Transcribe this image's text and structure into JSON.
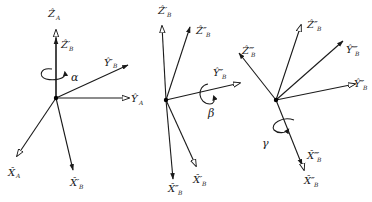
{
  "figure": {
    "panels": [
      {
        "id": "panel-1",
        "rotation": {
          "symbol": "α",
          "about": "Z"
        },
        "axes": [
          {
            "name": "Z",
            "hat": "^",
            "sub": "A",
            "prime": ""
          },
          {
            "name": "Z",
            "hat": "^",
            "sub": "B",
            "prime": "′"
          },
          {
            "name": "Y",
            "hat": "^",
            "sub": "B",
            "prime": "′"
          },
          {
            "name": "Y",
            "hat": "^",
            "sub": "A",
            "prime": ""
          },
          {
            "name": "X",
            "hat": "^",
            "sub": "A",
            "prime": ""
          },
          {
            "name": "X",
            "hat": "^",
            "sub": "B",
            "prime": "′"
          }
        ]
      },
      {
        "id": "panel-2",
        "rotation": {
          "symbol": "β",
          "about": "Y′"
        },
        "axes": [
          {
            "name": "Z",
            "hat": "^",
            "sub": "B",
            "prime": "′"
          },
          {
            "name": "Z",
            "hat": "^",
            "sub": "B",
            "prime": "″"
          },
          {
            "name": "Y",
            "hat": "^",
            "sub": "B",
            "prime": "″"
          },
          {
            "name": "X",
            "hat": "^",
            "sub": "B",
            "prime": "″"
          },
          {
            "name": "X",
            "hat": "^",
            "sub": "B",
            "prime": "′"
          }
        ]
      },
      {
        "id": "panel-3",
        "rotation": {
          "symbol": "γ",
          "about": "Z″"
        },
        "axes": [
          {
            "name": "Z",
            "hat": "^",
            "sub": "B",
            "prime": "″"
          },
          {
            "name": "Z",
            "hat": "^",
            "sub": "B",
            "prime": "‴"
          },
          {
            "name": "Y",
            "hat": "^",
            "sub": "B",
            "prime": "‴"
          },
          {
            "name": "Y",
            "hat": "^",
            "sub": "B",
            "prime": "″"
          },
          {
            "name": "X",
            "hat": "^",
            "sub": "B",
            "prime": "‴"
          },
          {
            "name": "X",
            "hat": "^",
            "sub": "B",
            "prime": "″"
          }
        ]
      }
    ]
  },
  "labels": {
    "p1": {
      "za": "Ẑ",
      "za_sub": "A",
      "zb1": "Ẑ′",
      "zb1_sub": "B",
      "yb1": "Ŷ′",
      "yb1_sub": "B",
      "ya": "Ŷ",
      "ya_sub": "A",
      "xa": "X̂",
      "xa_sub": "A",
      "xb1": "X̂′",
      "xb1_sub": "B",
      "alpha": "α"
    },
    "p2": {
      "zb1": "Ẑ′",
      "zb1_sub": "B",
      "zb2": "Ẑ″",
      "zb2_sub": "B",
      "yb2": "Ŷ″",
      "yb2_sub": "B",
      "xb2": "X̂″",
      "xb2_sub": "B",
      "xb1": "X̂′",
      "xb1_sub": "B",
      "beta": "β"
    },
    "p3": {
      "zb2": "Ẑ″",
      "zb2_sub": "B",
      "zb3": "Ẑ‴",
      "zb3_sub": "B",
      "yb3": "Ŷ‴",
      "yb3_sub": "B",
      "yb2": "Ŷ″",
      "yb2_sub": "B",
      "xb3": "X̂‴",
      "xb3_sub": "B",
      "xb2": "X̂″",
      "xb2_sub": "B",
      "gamma": "γ"
    }
  },
  "colors": {
    "ink": "#1a1a1a",
    "background": "#ffffff"
  }
}
